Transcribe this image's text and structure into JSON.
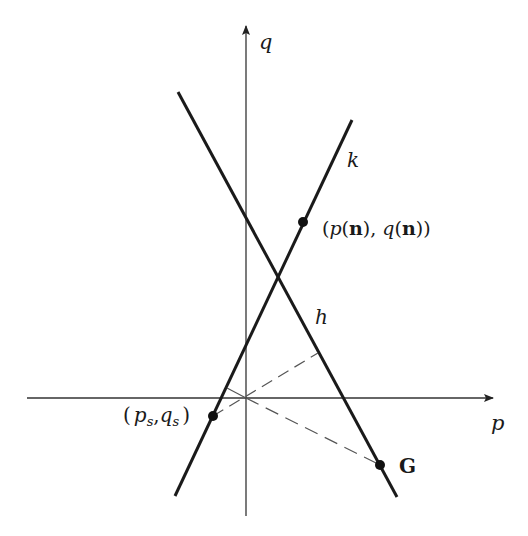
{
  "diagram": {
    "type": "geometric-construction",
    "axes": {
      "horizontal": {
        "label": "p"
      },
      "vertical": {
        "label": "q"
      }
    },
    "lines": [
      {
        "name": "k",
        "label": "k"
      },
      {
        "name": "h",
        "label": "h"
      }
    ],
    "points": [
      {
        "name": "p-n-q-n",
        "label_parts": [
          "(",
          "p",
          "(",
          "n",
          "), ",
          "q",
          "(",
          "n",
          "))"
        ]
      },
      {
        "name": "ps-qs",
        "label": "(p_s, q_s)"
      },
      {
        "name": "G",
        "label": "G"
      }
    ],
    "labels": {
      "q": "q",
      "p": "p",
      "k": "k",
      "h": "h",
      "G": "G",
      "pn_open": "(",
      "pn_p": "p",
      "pn_paren1": "(",
      "pn_n1": "n",
      "pn_mid": "), ",
      "pn_q": "q",
      "pn_paren2": "(",
      "pn_n2": "n",
      "pn_close": "))",
      "ps_open": "(",
      "ps_p": "p",
      "ps_sub1": "s",
      "ps_comma": ",",
      "ps_q": "q",
      "ps_sub2": "s",
      "ps_close": ")"
    },
    "colors": {
      "ink": "#1a1a1a",
      "axis": "#333333",
      "dash": "#555555"
    }
  }
}
